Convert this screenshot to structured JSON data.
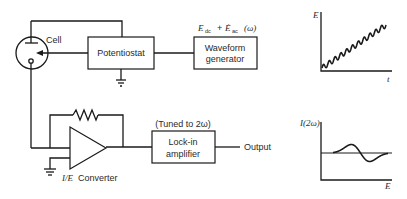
{
  "diagram": {
    "cell_label": "Cell",
    "potentiostat_label": "Potentiostat",
    "waveform_label_line1": "Waveform",
    "waveform_label_line2": "generator",
    "waveform_signal": {
      "e_dc": "E",
      "dc_sub": "dc",
      "plus": "+",
      "e_ac": "Ė",
      "ac_sub": "ac",
      "omega": "(ω)"
    },
    "lockin_label_line1": "Lock-in",
    "lockin_label_line2": "amplifier",
    "lockin_tuned": "(Tuned to 2ω)",
    "output_label": "Output",
    "converter_label_italic": "I/E",
    "converter_label": "Converter"
  },
  "plots": {
    "top": {
      "ylabel": "E",
      "xlabel": "t",
      "description": "staircase-like ramp with superimposed sinusoid"
    },
    "bottom": {
      "ylabel": "I(2ω)",
      "xlabel": "E",
      "description": "second-harmonic response: positive lobe then negative lobe"
    }
  }
}
